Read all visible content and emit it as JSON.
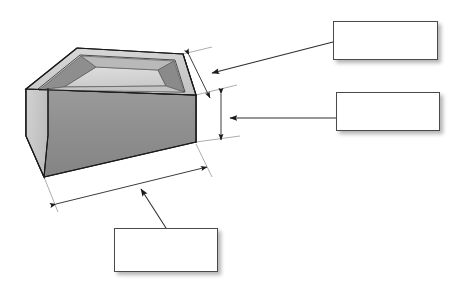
{
  "colors": {
    "outline": "#1a1a1a",
    "box_border": "#4a4a4a",
    "box_fill": "#ffffff",
    "page_background": "#ffffff",
    "top_face": "#cfcfcf",
    "left_face": "#c8c8c8",
    "front_face": "#8f8f8f",
    "end_face": "#fbfbfb",
    "frog_floor": "#d6d6d6",
    "frog_wall_dark": "#8c8c8c",
    "frog_wall_mid": "#a8a8a8",
    "dimension_line": "#7a7a7a",
    "leader_line": "#3a3a3a"
  },
  "callouts": [
    {
      "id": "callout-1",
      "label": "",
      "placeholder": "",
      "points_to": "width-dimension"
    },
    {
      "id": "callout-2",
      "label": "",
      "placeholder": "",
      "points_to": "height-dimension"
    },
    {
      "id": "callout-3",
      "label": "",
      "placeholder": "",
      "points_to": "length-dimension"
    }
  ],
  "dimensions": [
    {
      "name": "width-dimension",
      "label": "",
      "orientation": "oblique-right-upper"
    },
    {
      "name": "height-dimension",
      "label": "",
      "orientation": "vertical-right"
    },
    {
      "name": "length-dimension",
      "label": "",
      "orientation": "oblique-bottom"
    }
  ]
}
